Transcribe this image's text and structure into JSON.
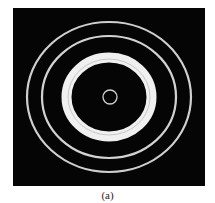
{
  "figure": {
    "caption": "(a)",
    "background_color": "#050505",
    "ring_color": "#d8d8d8",
    "band_color": "#eeeeee",
    "rings": [
      {
        "name": "center-ring",
        "rx": 7,
        "ry": 7,
        "stroke": 1.3
      },
      {
        "name": "bright-band",
        "rx": 42,
        "ry": 39,
        "stroke": 10
      },
      {
        "name": "middle-ring",
        "rx": 67,
        "ry": 61,
        "stroke": 2.2
      },
      {
        "name": "outer-ring",
        "rx": 82,
        "ry": 75,
        "stroke": 2.2
      }
    ]
  }
}
